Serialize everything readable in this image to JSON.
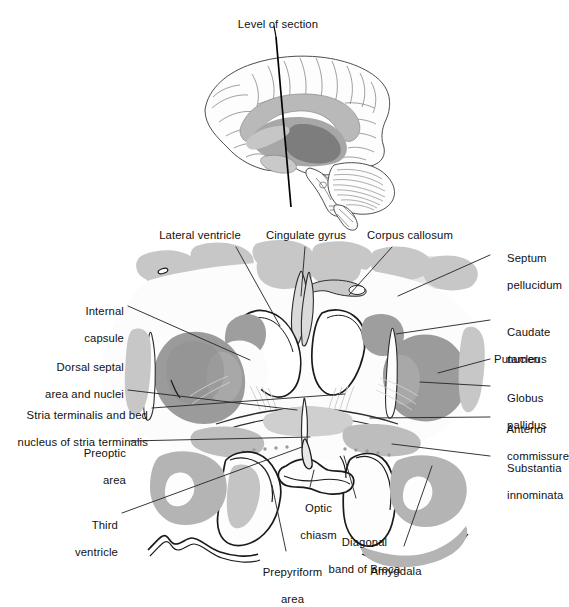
{
  "figure": {
    "type": "anatomical-diagram",
    "orientation": "coronal",
    "inset_title": "Level of section",
    "palette": {
      "background": "#ffffff",
      "ink": "#1a1a1a",
      "gray_dark": "#9a9a9a",
      "gray_mid": "#b4b4b4",
      "gray_light": "#c9c9c9",
      "gray_pale": "#e2e2e2",
      "white_matter": "#ffffff",
      "leader_line": "#2b2b2b"
    }
  },
  "inset": {
    "name": "mid-sagittal-brain",
    "label": "Level of section",
    "description": "Lateral view of the brain with a vertical line marking the coronal plane of section",
    "parts": [
      "cerebral cortex",
      "corpus callosum",
      "basal ganglia",
      "brainstem",
      "cerebellum"
    ]
  },
  "labels": [
    {
      "id": "lateral-ventricle",
      "text": "Lateral ventricle",
      "side": "top",
      "align": "center"
    },
    {
      "id": "cingulate-gyrus",
      "text": "Cingulate gyrus",
      "side": "top",
      "align": "center"
    },
    {
      "id": "corpus-callosum",
      "text": "Corpus callosum",
      "side": "top",
      "align": "center"
    },
    {
      "id": "septum-pellucidum",
      "text": "Septum\npellucidum",
      "side": "right",
      "align": "left"
    },
    {
      "id": "caudate-nucleus",
      "text": "Caudate\nnucleus",
      "side": "right",
      "align": "left"
    },
    {
      "id": "putamen",
      "text": "Putamen",
      "side": "right",
      "align": "left"
    },
    {
      "id": "globus-pallidus",
      "text": "Globus\npallidus",
      "side": "right",
      "align": "left"
    },
    {
      "id": "anterior-commissure",
      "text": "Anterior\ncommissure",
      "side": "right",
      "align": "left"
    },
    {
      "id": "substantia-innominata",
      "text": "Substantia\ninnominata",
      "side": "right",
      "align": "left"
    },
    {
      "id": "internal-capsule",
      "text": "Internal\ncapsule",
      "side": "left",
      "align": "right"
    },
    {
      "id": "dorsal-septal-area",
      "text": "Dorsal septal\narea and nuclei",
      "side": "left",
      "align": "right"
    },
    {
      "id": "stria-terminalis",
      "text": "Stria terminalis and bed\nnucleus of stria terminalis",
      "side": "left",
      "align": "right"
    },
    {
      "id": "preoptic-area",
      "text": "Preoptic\narea",
      "side": "left",
      "align": "right"
    },
    {
      "id": "third-ventricle",
      "text": "Third\nventricle",
      "side": "left",
      "align": "right"
    },
    {
      "id": "prepyriform-area",
      "text": "Prepyriform\narea",
      "side": "bottom",
      "align": "center"
    },
    {
      "id": "optic-chiasm",
      "text": "Optic\nchiasm",
      "side": "bottom",
      "align": "center"
    },
    {
      "id": "diagonal-band",
      "text": "Diagonal\nband of Broca",
      "side": "bottom",
      "align": "center"
    },
    {
      "id": "amygdala",
      "text": "Amygdala",
      "side": "bottom",
      "align": "center"
    }
  ],
  "label_text": {
    "level_of_section": "Level of section",
    "lateral_ventricle": "Lateral ventricle",
    "cingulate_gyrus": "Cingulate gyrus",
    "corpus_callosum": "Corpus callosum",
    "septum_pellucidum_1": "Septum",
    "septum_pellucidum_2": "pellucidum",
    "caudate_nucleus_1": "Caudate",
    "caudate_nucleus_2": "nucleus",
    "putamen": "Putamen",
    "globus_pallidus_1": "Globus",
    "globus_pallidus_2": "pallidus",
    "anterior_commissure_1": "Anterior",
    "anterior_commissure_2": "commissure",
    "substantia_innominata_1": "Substantia",
    "substantia_innominata_2": "innominata",
    "internal_capsule_1": "Internal",
    "internal_capsule_2": "capsule",
    "dorsal_septal_1": "Dorsal septal",
    "dorsal_septal_2": "area and nuclei",
    "stria_terminalis_1": "Stria terminalis and bed",
    "stria_terminalis_2": "nucleus of stria terminalis",
    "preoptic_area_1": "Preoptic",
    "preoptic_area_2": "area",
    "third_ventricle_1": "Third",
    "third_ventricle_2": "ventricle",
    "prepyriform_area_1": "Prepyriform",
    "prepyriform_area_2": "area",
    "optic_chiasm_1": "Optic",
    "optic_chiasm_2": "chiasm",
    "diagonal_band_1": "Diagonal",
    "diagonal_band_2": "band of Broca",
    "amygdala": "Amygdala"
  }
}
